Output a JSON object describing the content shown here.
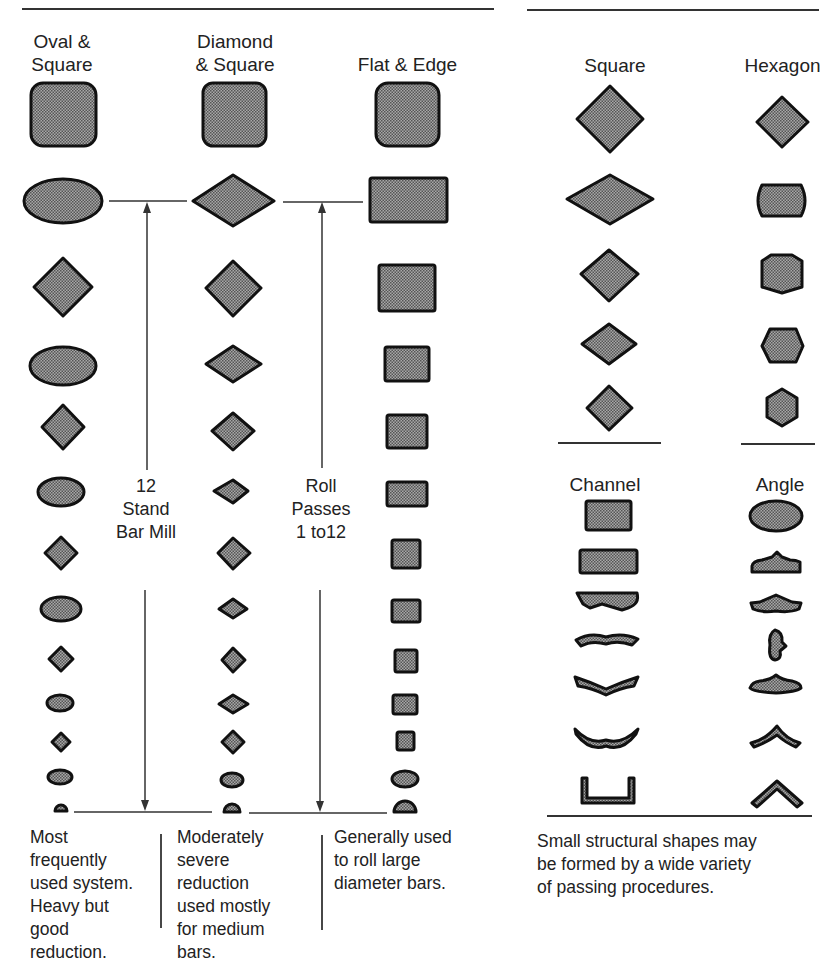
{
  "left_panel": {
    "columns": [
      {
        "header": [
          "Oval &",
          "Square"
        ],
        "description": [
          "Most",
          "frequently",
          "used system.",
          "Heavy but",
          "good",
          "reduction."
        ]
      },
      {
        "header": [
          "Diamond",
          "& Square"
        ],
        "description": [
          "Moderately",
          "severe",
          "reduction",
          "used mostly",
          "for medium",
          "bars."
        ]
      },
      {
        "header": [
          "Flat & Edge"
        ],
        "description": [
          "Generally used",
          "to roll large",
          "diameter bars."
        ]
      }
    ],
    "annotation_1": [
      "12",
      "Stand",
      "Bar Mill"
    ],
    "annotation_2": [
      "Roll",
      "Passes",
      "1 to12"
    ]
  },
  "right_panel": {
    "top_columns": [
      {
        "header": "Square"
      },
      {
        "header": "Hexagon"
      }
    ],
    "bottom_columns": [
      {
        "header": "Channel"
      },
      {
        "header": "Angle"
      }
    ],
    "description": [
      "Small structural shapes may",
      "be formed by a wide variety",
      "of passing procedures."
    ]
  },
  "colors": {
    "fill": "#8c8c8c",
    "stroke": "#111111",
    "text": "#222222",
    "rule": "#333333"
  }
}
